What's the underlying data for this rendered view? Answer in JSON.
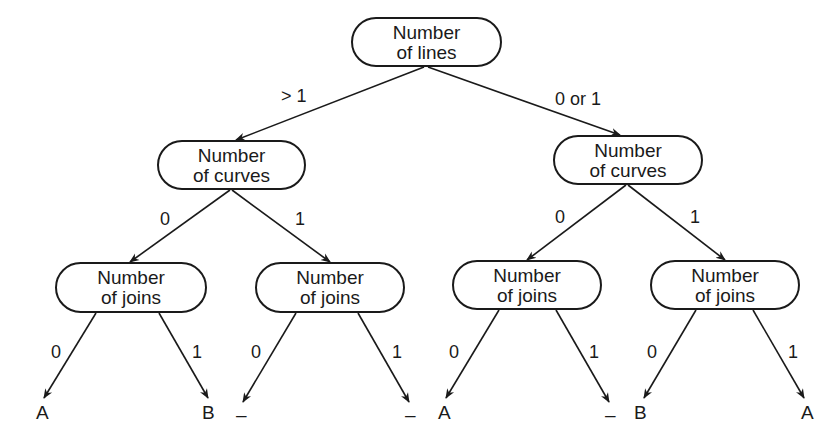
{
  "tree": {
    "root": {
      "line1": "Number",
      "line2": "of lines"
    },
    "level1": [
      {
        "edge_label": "> 1",
        "line1": "Number",
        "line2": "of curves"
      },
      {
        "edge_label": "0 or 1",
        "line1": "Number",
        "line2": "of curves"
      }
    ],
    "level2": [
      {
        "edge_label": "0",
        "line1": "Number",
        "line2": "of joins"
      },
      {
        "edge_label": "1",
        "line1": "Number",
        "line2": "of joins"
      },
      {
        "edge_label": "0",
        "line1": "Number",
        "line2": "of joins"
      },
      {
        "edge_label": "1",
        "line1": "Number",
        "line2": "of joins"
      }
    ],
    "leaves": [
      {
        "edge_label": "0",
        "value": "A"
      },
      {
        "edge_label": "1",
        "value": "B"
      },
      {
        "edge_label": "0",
        "value": "–"
      },
      {
        "edge_label": "1",
        "value": "–"
      },
      {
        "edge_label": "0",
        "value": "A"
      },
      {
        "edge_label": "1",
        "value": "–"
      },
      {
        "edge_label": "0",
        "value": "B"
      },
      {
        "edge_label": "1",
        "value": "A"
      }
    ]
  }
}
